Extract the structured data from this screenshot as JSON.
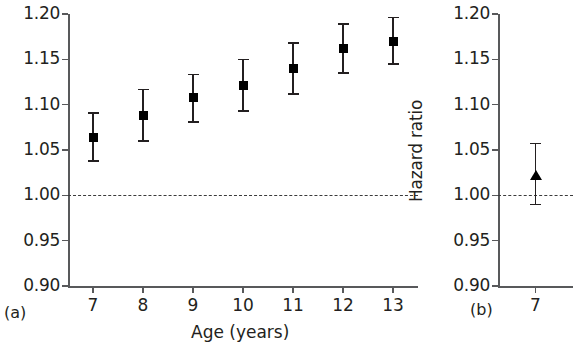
{
  "figure": {
    "panels": [
      {
        "tag": "(a)",
        "ylabel": "Hazard ratio",
        "xlabel": "Age (years)"
      },
      {
        "tag": "(b)",
        "ylabel": "Hazard ratio",
        "xlabel": ""
      }
    ]
  },
  "chart_data": [
    {
      "type": "scatter",
      "panel": "(a)",
      "title": "",
      "xlabel": "Age (years)",
      "ylabel": "Hazard ratio",
      "xlim": [
        6.5,
        13.5
      ],
      "ylim": [
        0.9,
        1.2
      ],
      "ytick_labels": [
        "1.20",
        "1.15",
        "1.10",
        "1.05",
        "1.00",
        "0.95",
        "0.90"
      ],
      "ytick_values": [
        1.2,
        1.15,
        1.1,
        1.05,
        1.0,
        0.95,
        0.9
      ],
      "xtick_labels": [
        "7",
        "8",
        "9",
        "10",
        "11",
        "12",
        "13"
      ],
      "x": [
        7,
        8,
        9,
        10,
        11,
        12,
        13
      ],
      "values": [
        1.064,
        1.088,
        1.108,
        1.121,
        1.14,
        1.162,
        1.17
      ],
      "ci_lower": [
        1.038,
        1.06,
        1.081,
        1.093,
        1.112,
        1.135,
        1.145
      ],
      "ci_upper": [
        1.091,
        1.117,
        1.133,
        1.15,
        1.168,
        1.189,
        1.196
      ],
      "marker": "square",
      "reference_line": 1.0,
      "grid": false,
      "legend": "none"
    },
    {
      "type": "scatter",
      "panel": "(b)",
      "title": "",
      "xlabel": "",
      "ylabel": "Hazard ratio",
      "xlim": [
        6.5,
        7.5
      ],
      "ylim": [
        0.9,
        1.2
      ],
      "ytick_labels": [
        "1.20",
        "1.15",
        "1.10",
        "1.05",
        "1.00",
        "0.95",
        "0.90"
      ],
      "ytick_values": [
        1.2,
        1.15,
        1.1,
        1.05,
        1.0,
        0.95,
        0.9
      ],
      "xtick_labels": [
        "7"
      ],
      "x": [
        7
      ],
      "values": [
        1.022
      ],
      "ci_lower": [
        0.99
      ],
      "ci_upper": [
        1.057
      ],
      "marker": "triangle",
      "reference_line": 1.0,
      "grid": false,
      "legend": "none"
    }
  ]
}
